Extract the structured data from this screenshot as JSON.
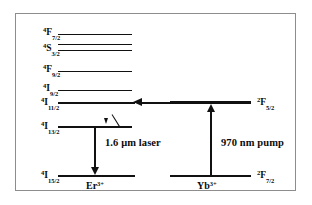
{
  "figure": {
    "kind": "energy-level-diagram",
    "system": "Er3+ / Yb3+ co-doped laser",
    "line_color": "#111111",
    "border_color": "#8d8d8d",
    "background": "#ffffff"
  },
  "er": {
    "ion_label_pre": "",
    "ion_label": "Er",
    "ion_charge": "3+",
    "levels": [
      {
        "name": "4F7/2",
        "multiplicity": "4",
        "term": "F",
        "j": "7/2",
        "label_x": 42,
        "label_y": 26,
        "line_x": 57,
        "line_y": 33,
        "line_w": 74,
        "line_h": 1.2
      },
      {
        "name": "4S3/2a",
        "multiplicity": "",
        "term": "",
        "j": "",
        "label_x": 0,
        "label_y": 0,
        "line_x": 57,
        "line_y": 43,
        "line_w": 74,
        "line_h": 1.2
      },
      {
        "name": "4S3/2",
        "multiplicity": "4",
        "term": "S",
        "j": "3/2",
        "label_x": 42,
        "label_y": 42,
        "line_x": 57,
        "line_y": 49,
        "line_w": 74,
        "line_h": 1.2
      },
      {
        "name": "4F9/2",
        "multiplicity": "4",
        "term": "F",
        "j": "9/2",
        "label_x": 42,
        "label_y": 63,
        "line_x": 57,
        "line_y": 70,
        "line_w": 74,
        "line_h": 1.2
      },
      {
        "name": "4I9/2",
        "multiplicity": "4",
        "term": "I",
        "j": "9/2",
        "label_x": 42,
        "label_y": 82,
        "line_x": 57,
        "line_y": 89,
        "line_w": 74,
        "line_h": 1.2
      },
      {
        "name": "4I11/2",
        "multiplicity": "4",
        "term": "I",
        "j": "11/2",
        "label_x": 40,
        "label_y": 96,
        "line_x": 57,
        "line_y": 102,
        "line_w": 76,
        "line_h": 1.8
      },
      {
        "name": "4I13/2",
        "multiplicity": "4",
        "term": "I",
        "j": "13/2",
        "label_x": 40,
        "label_y": 120,
        "line_x": 57,
        "line_y": 126,
        "line_w": 74,
        "line_h": 1.8
      },
      {
        "name": "4I15/2",
        "multiplicity": "4",
        "term": "I",
        "j": "15/2",
        "label_x": 40,
        "label_y": 169,
        "line_x": 57,
        "line_y": 175,
        "line_w": 76,
        "line_h": 1.8
      }
    ]
  },
  "yb": {
    "ion_label": "Yb",
    "ion_charge": "3+",
    "levels": [
      {
        "name": "2F5/2",
        "multiplicity": "2",
        "term": "F",
        "j": "5/2",
        "label_x": 256,
        "label_y": 96,
        "line_x": 169,
        "line_y": 101,
        "line_w": 81,
        "line_h": 3.4
      },
      {
        "name": "2F7/2",
        "multiplicity": "2",
        "term": "F",
        "j": "7/2",
        "label_x": 256,
        "label_y": 169,
        "line_x": 169,
        "line_y": 175,
        "line_w": 81,
        "line_h": 1.8
      }
    ]
  },
  "transitions": {
    "laser": {
      "label": "1.6 μm laser",
      "label_x": 104,
      "label_y": 142,
      "arrow_x": 94,
      "arrow_top": 127,
      "arrow_bottom": 175,
      "direction": "down"
    },
    "pump": {
      "label": "970 nm pump",
      "label_x": 221,
      "label_y": 142,
      "arrow_x": 210,
      "arrow_top": 104,
      "arrow_bottom": 175,
      "direction": "up"
    },
    "energy_transfer": {
      "label": "",
      "x_start": 166,
      "x_end": 134,
      "y": 102,
      "direction": "left"
    },
    "relaxation": {
      "label": "",
      "x": 106,
      "y_top": 114,
      "y_bottom": 125,
      "direction": "down"
    }
  }
}
